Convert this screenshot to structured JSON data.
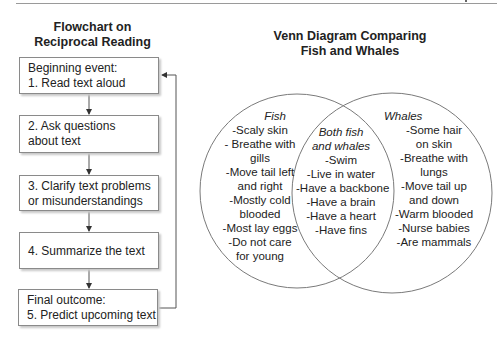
{
  "flowchart": {
    "title_line1": "Flowchart on",
    "title_line2": "Reciprocal Reading",
    "steps": [
      {
        "line1": "Beginning event:",
        "line2": "1. Read text aloud"
      },
      {
        "line1": "2. Ask questions",
        "line2": "about text"
      },
      {
        "line1": "3. Clarify text problems",
        "line2": "or misunderstandings"
      },
      {
        "line1": "4. Summarize the text",
        "line2": ""
      },
      {
        "line1": "Final outcome:",
        "line2": "5. Predict upcoming text"
      }
    ],
    "feedback_loop": "from step 5 back to step 1"
  },
  "venn": {
    "title_line1": "Venn Diagram Comparing",
    "title_line2": "Fish and Whales",
    "left": {
      "heading": "Fish",
      "lines": [
        "-Scaly skin",
        "- Breathe with",
        "gills",
        "-Move tail left",
        "and right",
        "-Mostly cold",
        "blooded",
        "-Most lay eggs",
        "-Do not care",
        "for young"
      ]
    },
    "overlap": {
      "heading_line1": "Both fish",
      "heading_line2": "and whales",
      "lines": [
        "-Swim",
        "-Live in water",
        "-Have a backbone",
        "-Have a brain",
        "-Have a heart",
        "-Have fins"
      ]
    },
    "right": {
      "heading": "Whales",
      "lines": [
        "-Some hair",
        "on skin",
        "-Breathe with",
        "lungs",
        "-Move tail up",
        "and down",
        "-Warm blooded",
        "-Nurse babies",
        "-Are mammals"
      ]
    }
  },
  "colors": {
    "line": "#7a7a7a",
    "text": "#222222"
  }
}
